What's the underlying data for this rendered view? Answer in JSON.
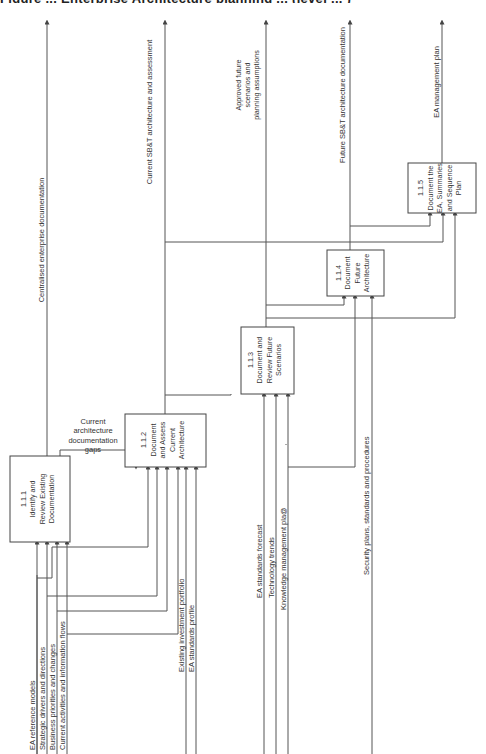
{
  "figure": {
    "caption_cut": "Figure ... Enterprise Architecture planning ... (level ... )",
    "orientation": "rotated-90-ccw"
  },
  "activities": [
    {
      "id": "1.1.1",
      "lines": [
        "1.1.1",
        "Identify and",
        "Review Existing",
        "Documentation"
      ]
    },
    {
      "id": "1.1.2",
      "lines": [
        "1.1.2",
        "Document",
        "and Assess",
        "Current",
        "Architecture"
      ]
    },
    {
      "id": "1.1.3",
      "lines": [
        "1.1.3",
        "Document and",
        "Review Future",
        "Scenarios"
      ]
    },
    {
      "id": "1.1.4",
      "lines": [
        "1.1.4",
        "Document",
        "Future",
        "Architecture"
      ]
    },
    {
      "id": "1.1.5",
      "lines": [
        "1.1.5",
        "Document the",
        "EA, Summaries",
        "and Sequence",
        "Plan"
      ]
    }
  ],
  "outputs": [
    {
      "label": "Centralised enterprise documentation"
    },
    {
      "label": "Current SB&T architecture and assessment"
    },
    {
      "label": "Approved future scenarios and planning assumptions",
      "lines": [
        "Approved future",
        "scenarios and",
        "planning assumptions"
      ]
    },
    {
      "label": "Future SB&T architecture documentation"
    },
    {
      "label": "EA management plan"
    }
  ],
  "intermediate": {
    "label": "Current architecture documentation gaps",
    "lines": [
      "Current",
      "architecture",
      "documentation",
      "gaps"
    ]
  },
  "inputs": [
    {
      "label": "EA reference models"
    },
    {
      "label": "Strategic drivers and directions"
    },
    {
      "label": "Business priorities and changes"
    },
    {
      "label": "Current activities and information flows"
    },
    {
      "label": "Existing investment portfolio"
    },
    {
      "label": "EA standards profile"
    },
    {
      "label": "EA standards forecast"
    },
    {
      "label": "Technology trends"
    },
    {
      "label": "Knowledge management pla@"
    },
    {
      "label": "Security plans, standards and procedures"
    }
  ],
  "colors": {
    "line": "#555555",
    "box": "#444444",
    "text": "#333333",
    "background": "#ffffff"
  }
}
